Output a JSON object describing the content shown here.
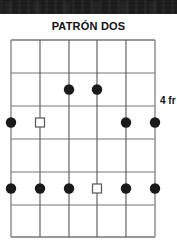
{
  "banner": {
    "ghost_text": "▓▒░ ▓▒░ ▓▒░ ▓▒░ ▓▒░ ▓▒░",
    "color": "#1b1b1b"
  },
  "title": "PATRÓN DOS",
  "position_label": "4 fr",
  "colors": {
    "grid_line": "#777777",
    "grid_border": "#888888",
    "string_line": "#555555",
    "dot_fill": "#1a1a1a",
    "square_stroke": "#555555",
    "square_fill": "#ffffff",
    "text": "#111111",
    "background": "#ffffff"
  },
  "diagram": {
    "type": "guitar-scale-pattern",
    "string_count": 6,
    "fret_count": 6,
    "string_x": [
      11,
      40,
      69,
      97,
      126,
      155
    ],
    "fret_y": [
      40,
      73,
      106,
      139,
      172,
      205,
      237
    ],
    "markers": [
      {
        "string": 3,
        "fret": 2,
        "shape": "filled-dot"
      },
      {
        "string": 4,
        "fret": 2,
        "shape": "filled-dot"
      },
      {
        "string": 1,
        "fret": 3,
        "shape": "filled-dot"
      },
      {
        "string": 2,
        "fret": 3,
        "shape": "open-square"
      },
      {
        "string": 5,
        "fret": 3,
        "shape": "filled-dot"
      },
      {
        "string": 6,
        "fret": 3,
        "shape": "filled-dot"
      },
      {
        "string": 1,
        "fret": 5,
        "shape": "filled-dot"
      },
      {
        "string": 2,
        "fret": 5,
        "shape": "filled-dot"
      },
      {
        "string": 3,
        "fret": 5,
        "shape": "filled-dot"
      },
      {
        "string": 4,
        "fret": 5,
        "shape": "open-square"
      },
      {
        "string": 5,
        "fret": 5,
        "shape": "filled-dot"
      },
      {
        "string": 6,
        "fret": 5,
        "shape": "filled-dot"
      }
    ]
  }
}
